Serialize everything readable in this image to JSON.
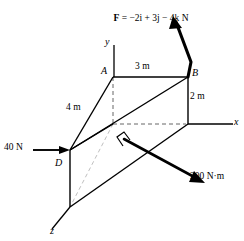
{
  "figure": {
    "kind": "engineering-statics-free-body-diagram",
    "background_color": "#ffffff",
    "line_color": "#000000",
    "faint_line_color": "#b0b0b0",
    "width": 244,
    "height": 241
  },
  "axes": {
    "y_label": "y",
    "x_label": "x",
    "z_label": "z"
  },
  "vertices": {
    "a_label": "A",
    "b_label": "B",
    "d_label": "D"
  },
  "dimensions": {
    "top_edge": "3 m",
    "right_edge": "2 m",
    "slant_edge": "4 m"
  },
  "loads": {
    "force_vector": "F = −2i + 3j − 4k N",
    "force_vector_symbol": "F",
    "force_vector_expression": " = −2i + 3j − 4k N",
    "point_force": "40 N",
    "moment": "200 N·m"
  }
}
